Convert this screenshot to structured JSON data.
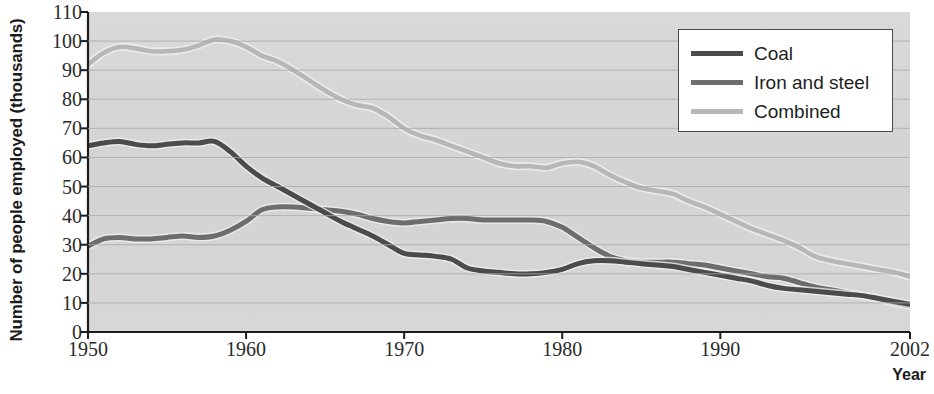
{
  "chart_data": {
    "type": "line",
    "title": "",
    "xlabel": "Year",
    "ylabel": "Number of people employed (thousands)",
    "xlim": [
      1950,
      2002
    ],
    "ylim": [
      0,
      110
    ],
    "xticks": [
      1950,
      1960,
      1970,
      1980,
      1990,
      2002
    ],
    "xticklabels": [
      "1950",
      "1960",
      "1970",
      "1980",
      "1990",
      "2002"
    ],
    "yticks": [
      0,
      10,
      20,
      30,
      40,
      50,
      60,
      70,
      80,
      90,
      100,
      110
    ],
    "yticklabels": [
      "0",
      "10",
      "20",
      "30",
      "40",
      "50",
      "60",
      "70",
      "80",
      "90",
      "100",
      "110"
    ],
    "grid": "horizontal",
    "legend_position": "top-right",
    "x": [
      1950,
      1951,
      1952,
      1953,
      1954,
      1955,
      1956,
      1957,
      1958,
      1959,
      1960,
      1961,
      1962,
      1963,
      1964,
      1965,
      1966,
      1967,
      1968,
      1969,
      1970,
      1971,
      1972,
      1973,
      1974,
      1975,
      1976,
      1977,
      1978,
      1979,
      1980,
      1981,
      1982,
      1983,
      1984,
      1985,
      1986,
      1987,
      1988,
      1989,
      1990,
      1991,
      1992,
      1993,
      1994,
      1995,
      1996,
      1997,
      1998,
      1999,
      2000,
      2001,
      2002
    ],
    "series": [
      {
        "name": "Coal",
        "color": "#4b4b4b",
        "values": [
          64,
          65,
          65.5,
          64.5,
          64,
          64.5,
          65,
          65,
          65.5,
          62,
          57,
          53,
          50,
          47,
          44,
          41,
          38,
          35.5,
          33,
          30,
          27,
          26.5,
          26,
          25,
          22,
          21,
          20.5,
          20,
          20,
          20.5,
          21.5,
          23.5,
          24.5,
          24.5,
          24,
          23.5,
          23,
          22.5,
          21.5,
          20.5,
          19.5,
          18.5,
          17.5,
          16,
          15,
          14.5,
          14,
          13.5,
          13,
          12.5,
          11.5,
          10.5,
          9.5
        ]
      },
      {
        "name": "Iron and steel",
        "color": "#6d6d6d",
        "values": [
          29.5,
          32,
          32.5,
          32,
          32,
          32.5,
          33,
          32.5,
          33,
          35,
          38,
          42,
          43,
          43,
          42.5,
          42,
          41.5,
          40.5,
          39,
          38,
          37.5,
          38,
          38.5,
          39,
          39,
          38.5,
          38.5,
          38.5,
          38.5,
          38,
          36,
          32.5,
          29,
          26,
          24.5,
          24,
          24,
          24,
          23.5,
          23,
          22,
          21,
          20,
          19,
          18.5,
          17,
          15.5,
          14.5,
          13.5,
          12.5,
          11.5,
          10,
          9
        ]
      },
      {
        "name": "Combined",
        "color": "#b7b7b7",
        "values": [
          92,
          96,
          98,
          97.5,
          96.5,
          96.5,
          97,
          98.5,
          100.5,
          100,
          98,
          95,
          93,
          90,
          86.5,
          83,
          80,
          78,
          77,
          74,
          70,
          67.5,
          66,
          64,
          62,
          60,
          58,
          57,
          57,
          56.5,
          58,
          58.5,
          57,
          54,
          51.5,
          49.5,
          48.5,
          47.5,
          45,
          43,
          40.5,
          38,
          35.5,
          33.5,
          31.5,
          29,
          26,
          24.5,
          23.5,
          22.5,
          21.5,
          20.5,
          19
        ]
      }
    ]
  },
  "legend": {
    "items": [
      {
        "label": "Coal",
        "color": "#4b4b4b"
      },
      {
        "label": "Iron and steel",
        "color": "#6d6d6d"
      },
      {
        "label": "Combined",
        "color": "#b7b7b7"
      }
    ]
  }
}
